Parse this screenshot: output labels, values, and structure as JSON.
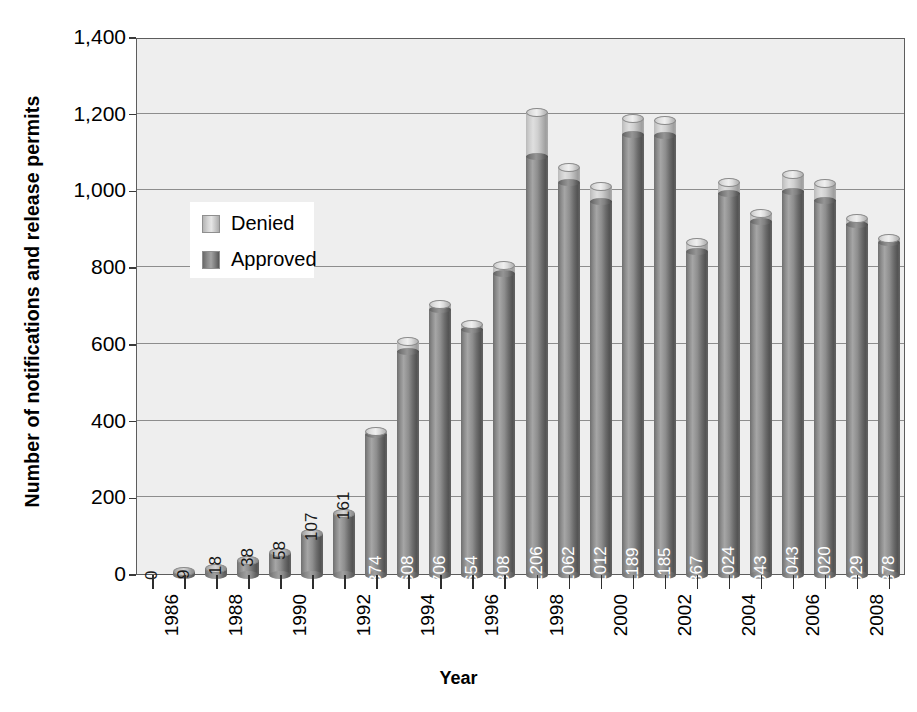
{
  "chart_data": {
    "type": "bar",
    "title": "",
    "subtitle": "",
    "xlabel": "Year",
    "ylabel": "Number of notifications and release permits",
    "ylim": [
      0,
      1400
    ],
    "ytick_values": [
      0,
      200,
      400,
      600,
      800,
      1000,
      1200,
      1400
    ],
    "ytick_labels": [
      "0",
      "200",
      "400",
      "600",
      "800",
      "1,000",
      "1,200",
      "1,400"
    ],
    "grid": true,
    "legend_position": "upper-left-inside",
    "stacked": true,
    "categories": [
      "1986",
      "1987",
      "1988",
      "1989",
      "1990",
      "1991",
      "1992",
      "1993",
      "1994",
      "1995",
      "1996",
      "1997",
      "1998",
      "1999",
      "2000",
      "2001",
      "2002",
      "2003",
      "2004",
      "2005",
      "2006",
      "2007",
      "2008",
      "2009"
    ],
    "xtick_labels_shown": [
      "1986",
      "",
      "1988",
      "",
      "1990",
      "",
      "1992",
      "",
      "1994",
      "",
      "1996",
      "",
      "1998",
      "",
      "2000",
      "",
      "2002",
      "",
      "2004",
      "",
      "2006",
      "",
      "2008",
      ""
    ],
    "data_labels": [
      "0",
      "9",
      "18",
      "38",
      "58",
      "107",
      "161",
      "374",
      "608",
      "706",
      "654",
      "808",
      "1206",
      "1062",
      "1012",
      "1189",
      "1185",
      "867",
      "1024",
      "943",
      "1043",
      "1020",
      "929",
      "878"
    ],
    "series": [
      {
        "name": "Approved",
        "color": "#7d7d7d",
        "values": [
          0,
          9,
          18,
          38,
          58,
          107,
          161,
          366,
          583,
          692,
          641,
          786,
          1092,
          1023,
          975,
          1148,
          1145,
          843,
          995,
          921,
          1000,
          977,
          915,
          866
        ]
      },
      {
        "name": "Denied",
        "color": "#d6d6d6",
        "values": [
          0,
          0,
          0,
          0,
          0,
          0,
          0,
          8,
          25,
          14,
          13,
          22,
          114,
          39,
          37,
          41,
          40,
          24,
          29,
          22,
          43,
          43,
          14,
          12
        ]
      }
    ],
    "totals": [
      0,
      9,
      18,
      38,
      58,
      107,
      161,
      374,
      608,
      706,
      654,
      808,
      1206,
      1062,
      1012,
      1189,
      1185,
      867,
      1024,
      943,
      1043,
      1020,
      929,
      878
    ]
  },
  "legend": {
    "items": [
      {
        "label": "Denied",
        "swatch": "denied"
      },
      {
        "label": "Approved",
        "swatch": "approved"
      }
    ]
  },
  "axes": {
    "y_title": "Number of notifications and release permits",
    "x_title": "Year"
  }
}
